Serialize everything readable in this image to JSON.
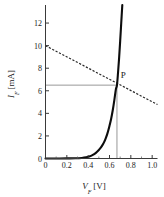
{
  "chart_data": {
    "type": "line",
    "title": "",
    "xlabel": "V_F [V]",
    "xlabel_symbol": "V",
    "xlabel_subscript": "F",
    "xlabel_unit": "[V]",
    "ylabel": "I_F [mA]",
    "ylabel_symbol": "I",
    "ylabel_subscript": "F",
    "ylabel_unit": "[mA]",
    "xlim": [
      0,
      1.05
    ],
    "ylim": [
      0,
      13.6
    ],
    "grid": false,
    "legend": "none",
    "xticks": [
      0,
      0.2,
      0.4,
      0.6,
      0.8,
      1.0
    ],
    "xtick_labels": [
      "0",
      "0.2",
      "0.4",
      "0.6",
      "0.8",
      "1.0"
    ],
    "xminor_ticks": [
      0.1,
      0.3,
      0.5,
      0.7,
      0.9
    ],
    "yticks": [
      0,
      2,
      4,
      6,
      8,
      10,
      12
    ],
    "ytick_labels": [
      "0",
      "2",
      "4",
      "6",
      "8",
      "10",
      "12"
    ],
    "series": [
      {
        "name": "diode-forward-characteristic",
        "style": "solid",
        "color": "#0d0d0d",
        "x": [
          0.0,
          0.1,
          0.2,
          0.28,
          0.34,
          0.38,
          0.41,
          0.44,
          0.47,
          0.5,
          0.52,
          0.54,
          0.56,
          0.58,
          0.6,
          0.615,
          0.63,
          0.645,
          0.66,
          0.67,
          0.68,
          0.69,
          0.7,
          0.71,
          0.72
        ],
        "y": [
          0.0,
          0.0,
          0.01,
          0.02,
          0.05,
          0.1,
          0.18,
          0.3,
          0.48,
          0.75,
          0.98,
          1.28,
          1.68,
          2.2,
          2.9,
          3.5,
          4.25,
          5.15,
          6.15,
          6.5,
          7.6,
          8.9,
          10.4,
          12.0,
          13.6
        ]
      },
      {
        "name": "load-line",
        "style": "dashed",
        "color": "#2a2a2a",
        "x": [
          0.0,
          1.05
        ],
        "y": [
          10.0,
          4.78
        ]
      }
    ],
    "annotations": [
      {
        "name": "operating-point",
        "label": "P",
        "x": 0.67,
        "y": 6.5,
        "label_offset_x": 0.035,
        "label_offset_y": 0.9
      }
    ],
    "guides": [
      {
        "name": "horizontal-guide-to-P",
        "orientation": "horizontal",
        "value": 6.5,
        "from": 0.0,
        "to": 0.67,
        "color": "#8c8c8c"
      },
      {
        "name": "vertical-guide-to-P",
        "orientation": "vertical",
        "value": 0.67,
        "from": 0.0,
        "to": 6.5,
        "color": "#8c8c8c"
      }
    ]
  }
}
